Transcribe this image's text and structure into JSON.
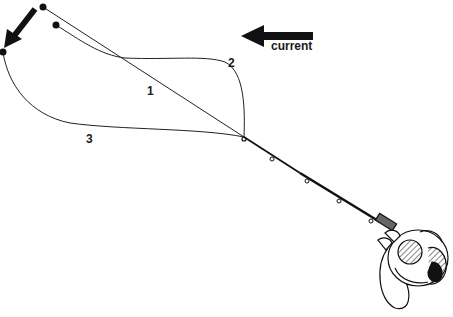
{
  "diagram": {
    "labels": {
      "path_1": "1",
      "path_2": "2",
      "path_3": "3",
      "current": "current"
    },
    "colors": {
      "ink": "#111111",
      "background": "#ffffff"
    },
    "elements": {
      "current_arrow": {
        "direction": "left",
        "icon": "arrow-left-icon"
      },
      "drift_arrow": {
        "direction": "down-left",
        "icon": "arrow-down-left-icon"
      },
      "line_paths": [
        {
          "id": "1",
          "shape": "straight line from rod tip to upper-left weight"
        },
        {
          "id": "2",
          "shape": "bowed line arcing upward-right then to upper-left weight"
        },
        {
          "id": "3",
          "shape": "bowed line arcing downward-left to far-left weight"
        }
      ],
      "rod": {
        "guides": 5
      },
      "reel": {
        "type": "spinning reel held in hand"
      }
    }
  }
}
